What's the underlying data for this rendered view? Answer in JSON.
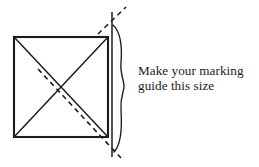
{
  "figure": {
    "background_color": "#ffffff",
    "stroke_color": "#1c1c1c",
    "square": {
      "label": "square-outline",
      "left": 14,
      "top": 37,
      "right": 108,
      "bottom": 137,
      "stroke_width": 2.1
    },
    "diagonals": [
      {
        "label": "diagonal-tl-br",
        "x1": 14,
        "y1": 37,
        "x2": 108,
        "y2": 137,
        "style": "solid"
      },
      {
        "label": "diagonal-bl-tr",
        "x1": 14,
        "y1": 137,
        "x2": 108,
        "y2": 37,
        "style": "solid"
      }
    ],
    "dashed_diagonal": {
      "label": "dashed-extension-line",
      "x1": 38,
      "y1": 69,
      "x2": 121,
      "y2": 158,
      "style": "dashed",
      "dash_pattern": "5 4"
    },
    "dashed_upper": {
      "label": "dashed-upper-extension",
      "x1": 100,
      "y1": 32,
      "x2": 125,
      "y2": 8,
      "style": "dashed",
      "dash_pattern": "5 4"
    },
    "vertical_reference_line": {
      "label": "vertical-reference-line",
      "x": 112,
      "y1": 12,
      "y2": 157,
      "stroke_width": 1.5
    },
    "brace": {
      "label": "size-brace",
      "top_y": 25,
      "bottom_y": 152,
      "tip_x": 124,
      "anchor_x": 113,
      "stroke_width": 1.3
    }
  },
  "caption": {
    "line_1": "Make your marking",
    "line_2": "guide this size"
  }
}
